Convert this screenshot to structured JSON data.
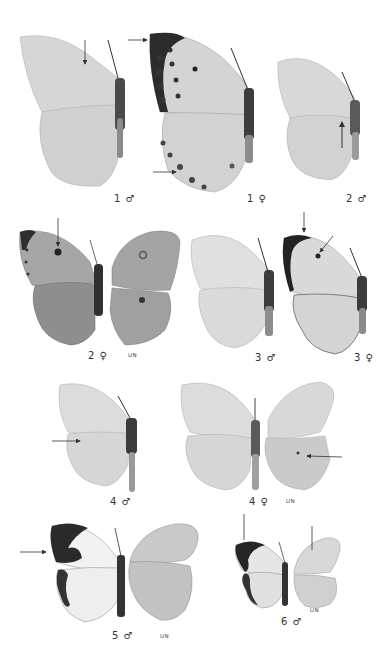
{
  "plate": {
    "figures": [
      {
        "id": "fig-1-male",
        "label": "1 ♂",
        "view": "upperside",
        "arrows": 1
      },
      {
        "id": "fig-1-female",
        "label": "1 ♀",
        "view": "upperside",
        "arrows": 2
      },
      {
        "id": "fig-2-male",
        "label": "2 ♂",
        "view": "upperside",
        "arrows": 1
      },
      {
        "id": "fig-2-female",
        "label": "2 ♀",
        "view": "upperside + underside",
        "underside_label": "UN",
        "arrows": 1
      },
      {
        "id": "fig-3-male",
        "label": "3 ♂",
        "view": "upperside",
        "arrows": 0
      },
      {
        "id": "fig-3-female",
        "label": "3 ♀",
        "view": "upperside",
        "arrows": 2
      },
      {
        "id": "fig-4-male",
        "label": "4 ♂",
        "view": "upperside",
        "arrows": 1
      },
      {
        "id": "fig-4-female",
        "label": "4 ♀",
        "view": "upperside + underside",
        "underside_label": "UN",
        "arrows": 1
      },
      {
        "id": "fig-5-male",
        "label": "5 ♂",
        "view": "upperside + underside",
        "underside_label": "UN",
        "arrows": 1
      },
      {
        "id": "fig-6-male",
        "label": "6 ♂",
        "view": "upperside + underside",
        "underside_label": "UN",
        "arrows": 2
      }
    ],
    "colors": {
      "background": "#ffffff",
      "wing_light": "#d9d9d9",
      "wing_mid": "#bdbdbd",
      "wing_dark": "#2b2b2b",
      "body": "#3a3a3a"
    }
  }
}
